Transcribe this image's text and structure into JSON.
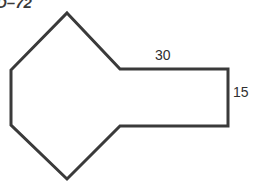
{
  "figure": {
    "problem_label": "D–72",
    "stroke_color": "#3a3a3a",
    "fill_color": "#ffffff",
    "background_color": "#ffffff",
    "stroke_width": 3,
    "polygon_points": "67,13 120,69 228,69 228,126 120,126 67,179 11,125 11,70",
    "labels": {
      "top_edge": "30",
      "right_edge": "15"
    }
  },
  "chart_data": {
    "type": "diagram",
    "title": "D–72",
    "shape": "composite polygon: hexagonal head joined to a rectangle",
    "vertices": [
      {
        "name": "top-apex",
        "x": 67,
        "y": 13
      },
      {
        "name": "upper-neck",
        "x": 120,
        "y": 69
      },
      {
        "name": "top-right",
        "x": 228,
        "y": 69
      },
      {
        "name": "bottom-right",
        "x": 228,
        "y": 126
      },
      {
        "name": "lower-neck",
        "x": 120,
        "y": 126
      },
      {
        "name": "bottom-apex",
        "x": 67,
        "y": 179
      },
      {
        "name": "lower-left",
        "x": 11,
        "y": 125
      },
      {
        "name": "upper-left",
        "x": 11,
        "y": 70
      }
    ],
    "dimensions": [
      {
        "label": "30",
        "edge": "top horizontal edge of rectangle",
        "value": 30
      },
      {
        "label": "15",
        "edge": "right vertical edge of rectangle",
        "value": 15
      }
    ],
    "xlabel": "",
    "ylabel": ""
  }
}
